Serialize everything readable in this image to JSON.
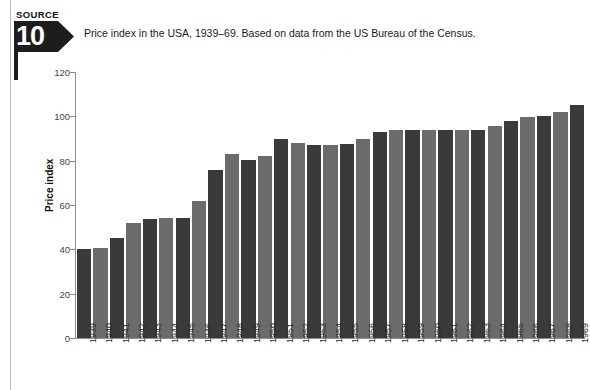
{
  "source_badge": {
    "word": "SOURCE",
    "number": "10"
  },
  "caption": "Price index in the USA, 1939–69. Based on data from the US Bureau of the Census.",
  "chart_data": {
    "type": "bar",
    "title": "Price index in the USA, 1939–69. Based on data from the US Bureau of the Census.",
    "xlabel": "",
    "ylabel": "Price index",
    "ylim": [
      0,
      120
    ],
    "yticks": [
      0,
      20,
      40,
      60,
      80,
      100,
      120
    ],
    "grid": false,
    "legend": "none",
    "bar_colors": [
      "#3a3a3a",
      "#6b6b6b"
    ],
    "categories": [
      "1939",
      "1940",
      "1941",
      "1942",
      "1943",
      "1944",
      "1945",
      "1946",
      "1947",
      "1948",
      "1949",
      "1950",
      "1951",
      "1952",
      "1953",
      "1954",
      "1955",
      "1956",
      "1957",
      "1958",
      "1959",
      "1960",
      "1961",
      "1962",
      "1963",
      "1964",
      "1965",
      "1966",
      "1967",
      "1968",
      "1969"
    ],
    "values": [
      40,
      40.5,
      45,
      52,
      53.5,
      54,
      54,
      62,
      76,
      83,
      80.5,
      82,
      90,
      88,
      87,
      87,
      87.5,
      90,
      93,
      94,
      94,
      94,
      94,
      94,
      94,
      95.5,
      98,
      99.5,
      100,
      102,
      105
    ]
  }
}
